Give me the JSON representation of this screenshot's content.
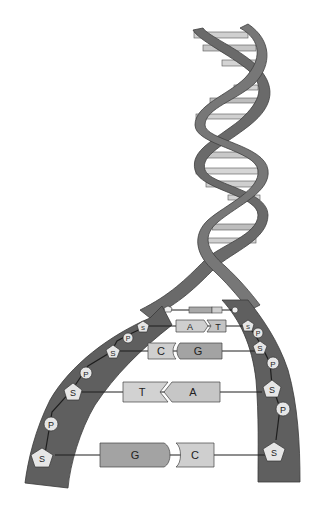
{
  "diagram": {
    "colors": {
      "backbone": "#6a6a6a",
      "backbone_edge": "#3f3f3f",
      "rung_light": "#d0d0d0",
      "rung_dark": "#a8a8a8",
      "base_light": "#cfcfcf",
      "base_dark": "#a3a3a3",
      "node_fill": "#e6e6e6",
      "line": "#1e1e1e"
    },
    "base_pairs": [
      {
        "left": "G",
        "right": "T",
        "note": "tiny pair near helix junction"
      },
      {
        "left": "A",
        "right": "T"
      },
      {
        "left": "C",
        "right": "G"
      },
      {
        "left": "T",
        "right": "A"
      },
      {
        "left": "G",
        "right": "C"
      }
    ],
    "labels": {
      "pair1_left": "G",
      "pair1_right": "T",
      "pair2_left": "A",
      "pair2_right": "T",
      "pair3_left": "C",
      "pair3_right": "G",
      "pair4_left": "T",
      "pair4_right": "A",
      "pair5_left": "G",
      "pair5_right": "C",
      "sugar": "S",
      "phosphate": "P"
    },
    "left_strand_nodes": [
      "S",
      "P",
      "S",
      "P",
      "S",
      "P",
      "S"
    ],
    "right_strand_nodes": [
      "S",
      "P",
      "S",
      "P",
      "S",
      "P",
      "S"
    ]
  }
}
